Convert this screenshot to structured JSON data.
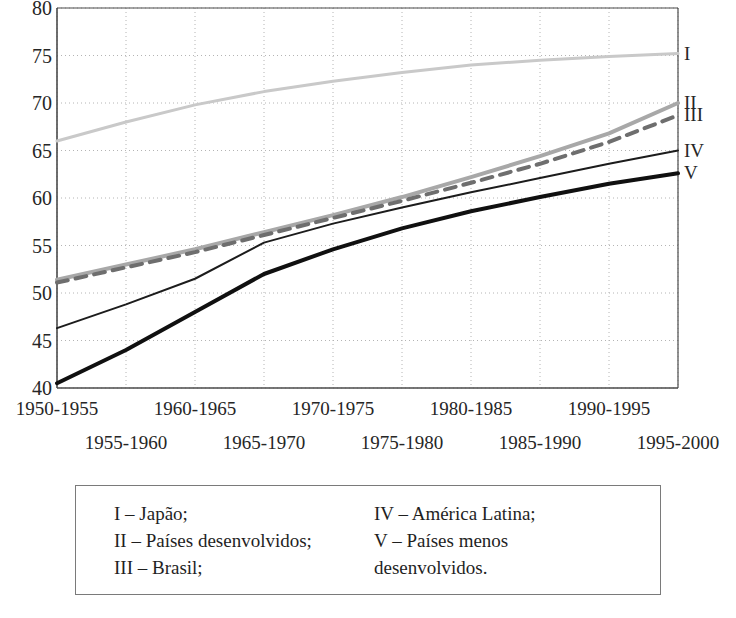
{
  "chart_data": {
    "type": "line",
    "title": "",
    "xlabel": "",
    "ylabel": "",
    "ylim": [
      40,
      80
    ],
    "y_ticks": [
      40,
      45,
      50,
      55,
      60,
      65,
      70,
      75,
      80
    ],
    "grid": true,
    "legend_position": "below-plot-box",
    "categories": [
      "1950-1955",
      "1955-1960",
      "1960-1965",
      "1965-1970",
      "1970-1975",
      "1975-1980",
      "1980-1985",
      "1985-1990",
      "1990-1995",
      "1995-2000"
    ],
    "series": [
      {
        "name": "I",
        "label": "Japão",
        "color": "#c9c9c9",
        "style": "solid",
        "width": 3,
        "end_label": "I",
        "values": [
          66.0,
          68.0,
          69.8,
          71.2,
          72.3,
          73.2,
          74.0,
          74.5,
          74.9,
          75.2
        ]
      },
      {
        "name": "II",
        "label": "Países desenvolvidos",
        "color": "#a8a8a8",
        "style": "solid",
        "width": 4,
        "end_label": "II",
        "values": [
          51.4,
          53.0,
          54.6,
          56.4,
          58.2,
          60.1,
          62.2,
          64.4,
          66.8,
          70.0
        ]
      },
      {
        "name": "III",
        "label": "Brasil",
        "color": "#6e6e6e",
        "style": "dashed",
        "width": 4,
        "end_label": "III",
        "values": [
          51.1,
          52.7,
          54.3,
          56.1,
          57.9,
          59.7,
          61.6,
          63.6,
          65.9,
          68.7
        ]
      },
      {
        "name": "IV",
        "label": "América Latina",
        "color": "#1c1c1c",
        "style": "solid",
        "width": 2,
        "end_label": "IV",
        "values": [
          46.3,
          48.8,
          51.5,
          55.3,
          57.3,
          59.0,
          60.6,
          62.1,
          63.6,
          65.0
        ]
      },
      {
        "name": "V",
        "label": "Países menos desenvolvidos",
        "color": "#101010",
        "style": "solid",
        "width": 4,
        "end_label": "V",
        "values": [
          40.5,
          44.0,
          48.0,
          52.0,
          54.6,
          56.8,
          58.6,
          60.1,
          61.5,
          62.6
        ]
      }
    ]
  },
  "axis": {
    "y_tick_labels": [
      "80",
      "75",
      "70",
      "65",
      "60",
      "55",
      "50",
      "45",
      "40"
    ],
    "x_tick_labels_top": [
      "1950-1955",
      "1960-1965",
      "1970-1975",
      "1980-1985",
      "1990-1995"
    ],
    "x_tick_labels_bottom": [
      "1955-1960",
      "1965-1970",
      "1975-1980",
      "1985-1990",
      "1995-2000"
    ]
  },
  "legend": {
    "left_column": [
      "I – Japão;",
      "II – Países desenvolvidos;",
      "III – Brasil;"
    ],
    "right_column": [
      "IV – América Latina;",
      "V – Países menos\ndesenvolvidos."
    ]
  },
  "colors": {
    "axis": "#4a4a4a",
    "grid": "#b4b4b4",
    "text": "#262626",
    "legend_border": "#7a7a7a"
  }
}
